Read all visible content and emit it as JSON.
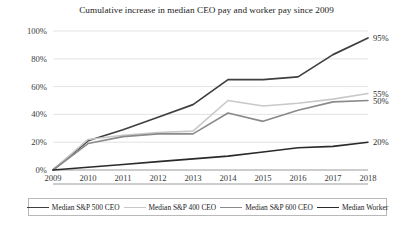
{
  "chart_data": {
    "type": "line",
    "title": "Cumulative increase in median CEO pay and worker pay since 2009",
    "xlabel": "",
    "ylabel": "",
    "categories": [
      "2009",
      "2010",
      "2011",
      "2012",
      "2013",
      "2014",
      "2015",
      "2016",
      "2017",
      "2018"
    ],
    "x": [
      2009,
      2010,
      2011,
      2012,
      2013,
      2014,
      2015,
      2016,
      2017,
      2018
    ],
    "ylim": [
      0,
      100
    ],
    "ytick_labels": [
      "0%",
      "20%",
      "40%",
      "60%",
      "80%",
      "100%"
    ],
    "ytick_values": [
      0,
      20,
      40,
      60,
      80,
      100
    ],
    "grid": true,
    "legend_position": "bottom",
    "series": [
      {
        "name": "Median S&P 500 CEO",
        "color": "#3f3f3f",
        "width": 1.7,
        "values": [
          0,
          21,
          29,
          38,
          47,
          65,
          65,
          67,
          83,
          95
        ],
        "end_label": "95%"
      },
      {
        "name": "Median S&P 400 CEO",
        "color": "#c8c8c8",
        "width": 1.6,
        "values": [
          0,
          22,
          25,
          27,
          28,
          50,
          46,
          48,
          51,
          55
        ],
        "end_label": "55%"
      },
      {
        "name": "Median S&P 600 CEO",
        "color": "#8a8a8a",
        "width": 1.6,
        "values": [
          0,
          19,
          24,
          26,
          26,
          41,
          35,
          43,
          49,
          50
        ],
        "end_label": "50%"
      },
      {
        "name": "Median Worker",
        "color": "#2a2a2a",
        "width": 1.6,
        "values": [
          0,
          2,
          4,
          6,
          8,
          10,
          13,
          16,
          17,
          20
        ],
        "end_label": "20%"
      }
    ]
  }
}
